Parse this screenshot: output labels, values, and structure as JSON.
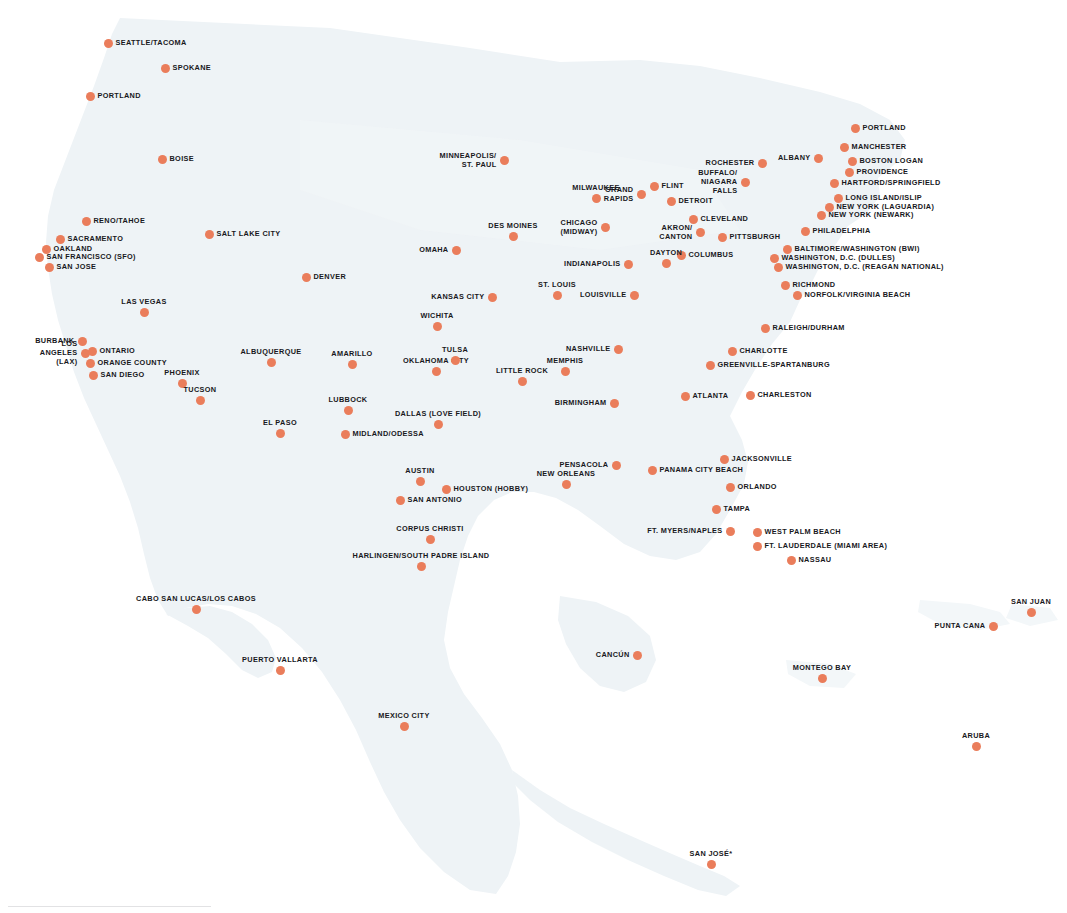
{
  "map": {
    "title": "Destination Route Map",
    "colors": {
      "dot": "#ea7d5b",
      "land": "#eef3f6",
      "label": "#18181c",
      "background": "#ffffff"
    },
    "footnote_marker": "*",
    "cities": [
      {
        "name": "SEATTLE/TACOMA",
        "x": 108,
        "y": 43,
        "pos": "right"
      },
      {
        "name": "SPOKANE",
        "x": 165,
        "y": 68,
        "pos": "right"
      },
      {
        "name": "PORTLAND",
        "x": 90,
        "y": 96,
        "pos": "right"
      },
      {
        "name": "BOISE",
        "x": 162,
        "y": 159,
        "pos": "right"
      },
      {
        "name": "RENO/TAHOE",
        "x": 86,
        "y": 221,
        "pos": "right"
      },
      {
        "name": "SACRAMENTO",
        "x": 60,
        "y": 239,
        "pos": "right"
      },
      {
        "name": "OAKLAND",
        "x": 46,
        "y": 249,
        "pos": "right"
      },
      {
        "name": "SAN FRANCISCO (SFO)",
        "x": 39,
        "y": 257,
        "pos": "right"
      },
      {
        "name": "SAN JOSE",
        "x": 49,
        "y": 267,
        "pos": "right"
      },
      {
        "name": "SALT LAKE CITY",
        "x": 209,
        "y": 234,
        "pos": "right"
      },
      {
        "name": "LAS VEGAS",
        "x": 144,
        "y": 312,
        "pos": "above"
      },
      {
        "name": "BURBANK",
        "x": 82,
        "y": 341,
        "pos": "left"
      },
      {
        "name": "LOS ANGELES\n(LAX)",
        "x": 85,
        "y": 353,
        "pos": "left2"
      },
      {
        "name": "ONTARIO",
        "x": 92,
        "y": 351,
        "pos": "right"
      },
      {
        "name": "ORANGE COUNTY",
        "x": 90,
        "y": 363,
        "pos": "right"
      },
      {
        "name": "SAN DIEGO",
        "x": 93,
        "y": 375,
        "pos": "right"
      },
      {
        "name": "PHOENIX",
        "x": 182,
        "y": 383,
        "pos": "above"
      },
      {
        "name": "TUCSON",
        "x": 200,
        "y": 400,
        "pos": "above"
      },
      {
        "name": "DENVER",
        "x": 306,
        "y": 277,
        "pos": "right"
      },
      {
        "name": "ALBUQUERQUE",
        "x": 271,
        "y": 362,
        "pos": "above"
      },
      {
        "name": "EL PASO",
        "x": 280,
        "y": 433,
        "pos": "above"
      },
      {
        "name": "AMARILLO",
        "x": 352,
        "y": 364,
        "pos": "above"
      },
      {
        "name": "LUBBOCK",
        "x": 348,
        "y": 410,
        "pos": "above"
      },
      {
        "name": "MIDLAND/ODESSA",
        "x": 345,
        "y": 434,
        "pos": "right"
      },
      {
        "name": "DALLAS (LOVE FIELD)",
        "x": 438,
        "y": 424,
        "pos": "above"
      },
      {
        "name": "OKLAHOMA CITY",
        "x": 436,
        "y": 371,
        "pos": "above"
      },
      {
        "name": "TULSA",
        "x": 455,
        "y": 360,
        "pos": "above"
      },
      {
        "name": "WICHITA",
        "x": 437,
        "y": 326,
        "pos": "above"
      },
      {
        "name": "KANSAS CITY",
        "x": 492,
        "y": 297,
        "pos": "left"
      },
      {
        "name": "OMAHA",
        "x": 456,
        "y": 250,
        "pos": "left"
      },
      {
        "name": "DES MOINES",
        "x": 513,
        "y": 236,
        "pos": "above"
      },
      {
        "name": "MINNEAPOLIS/\nST. PAUL",
        "x": 504,
        "y": 160,
        "pos": "left2"
      },
      {
        "name": "MILWAUKEE",
        "x": 596,
        "y": 198,
        "pos": "above"
      },
      {
        "name": "CHICAGO\n(MIDWAY)",
        "x": 605,
        "y": 227,
        "pos": "left2"
      },
      {
        "name": "GRAND\nRAPIDS",
        "x": 641,
        "y": 194,
        "pos": "left2"
      },
      {
        "name": "FLINT",
        "x": 654,
        "y": 186,
        "pos": "right"
      },
      {
        "name": "DETROIT",
        "x": 671,
        "y": 201,
        "pos": "right"
      },
      {
        "name": "CLEVELAND",
        "x": 693,
        "y": 219,
        "pos": "right"
      },
      {
        "name": "AKRON/\nCANTON",
        "x": 700,
        "y": 232,
        "pos": "left2"
      },
      {
        "name": "PITTSBURGH",
        "x": 722,
        "y": 237,
        "pos": "right"
      },
      {
        "name": "COLUMBUS",
        "x": 681,
        "y": 255,
        "pos": "right"
      },
      {
        "name": "DAYTON",
        "x": 666,
        "y": 263,
        "pos": "above"
      },
      {
        "name": "INDIANAPOLIS",
        "x": 628,
        "y": 264,
        "pos": "left"
      },
      {
        "name": "ST. LOUIS",
        "x": 557,
        "y": 295,
        "pos": "above"
      },
      {
        "name": "LOUISVILLE",
        "x": 634,
        "y": 295,
        "pos": "left"
      },
      {
        "name": "ROCHESTER",
        "x": 762,
        "y": 163,
        "pos": "left"
      },
      {
        "name": "BUFFALO/\nNIAGARA FALLS",
        "x": 745,
        "y": 182,
        "pos": "left2"
      },
      {
        "name": "ALBANY",
        "x": 818,
        "y": 158,
        "pos": "left"
      },
      {
        "name": "PORTLAND",
        "x": 855,
        "y": 128,
        "pos": "right"
      },
      {
        "name": "MANCHESTER",
        "x": 844,
        "y": 147,
        "pos": "right"
      },
      {
        "name": "BOSTON LOGAN",
        "x": 852,
        "y": 161,
        "pos": "right"
      },
      {
        "name": "PROVIDENCE",
        "x": 849,
        "y": 172,
        "pos": "right"
      },
      {
        "name": "HARTFORD/SPRINGFIELD",
        "x": 834,
        "y": 183,
        "pos": "right"
      },
      {
        "name": "LONG ISLAND/ISLIP",
        "x": 838,
        "y": 198,
        "pos": "right"
      },
      {
        "name": "NEW YORK (LAGUARDIA)",
        "x": 829,
        "y": 207,
        "pos": "right"
      },
      {
        "name": "NEW YORK (NEWARK)",
        "x": 821,
        "y": 215,
        "pos": "right"
      },
      {
        "name": "PHILADELPHIA",
        "x": 805,
        "y": 231,
        "pos": "right"
      },
      {
        "name": "BALTIMORE/WASHINGTON (BWI)",
        "x": 787,
        "y": 249,
        "pos": "right"
      },
      {
        "name": "WASHINGTON, D.C. (DULLES)",
        "x": 774,
        "y": 258,
        "pos": "right"
      },
      {
        "name": "WASHINGTON, D.C. (REAGAN NATIONAL)",
        "x": 778,
        "y": 267,
        "pos": "right"
      },
      {
        "name": "RICHMOND",
        "x": 785,
        "y": 285,
        "pos": "right"
      },
      {
        "name": "NORFOLK/VIRGINIA BEACH",
        "x": 797,
        "y": 295,
        "pos": "right"
      },
      {
        "name": "RALEIGH/DURHAM",
        "x": 765,
        "y": 328,
        "pos": "right"
      },
      {
        "name": "CHARLOTTE",
        "x": 732,
        "y": 351,
        "pos": "right"
      },
      {
        "name": "GREENVILLE-SPARTANBURG",
        "x": 710,
        "y": 365,
        "pos": "right"
      },
      {
        "name": "NASHVILLE",
        "x": 618,
        "y": 349,
        "pos": "left"
      },
      {
        "name": "MEMPHIS",
        "x": 565,
        "y": 371,
        "pos": "above"
      },
      {
        "name": "BIRMINGHAM",
        "x": 614,
        "y": 403,
        "pos": "left"
      },
      {
        "name": "ATLANTA",
        "x": 685,
        "y": 396,
        "pos": "right"
      },
      {
        "name": "CHARLESTON",
        "x": 750,
        "y": 395,
        "pos": "right"
      },
      {
        "name": "LITTLE ROCK",
        "x": 522,
        "y": 381,
        "pos": "above"
      },
      {
        "name": "AUSTIN",
        "x": 420,
        "y": 481,
        "pos": "above"
      },
      {
        "name": "HOUSTON (HOBBY)",
        "x": 446,
        "y": 489,
        "pos": "right"
      },
      {
        "name": "SAN ANTONIO",
        "x": 400,
        "y": 500,
        "pos": "right"
      },
      {
        "name": "CORPUS CHRISTI",
        "x": 430,
        "y": 539,
        "pos": "above"
      },
      {
        "name": "HARLINGEN/SOUTH PADRE ISLAND",
        "x": 421,
        "y": 566,
        "pos": "above"
      },
      {
        "name": "NEW ORLEANS",
        "x": 566,
        "y": 484,
        "pos": "above"
      },
      {
        "name": "PENSACOLA",
        "x": 616,
        "y": 465,
        "pos": "left"
      },
      {
        "name": "PANAMA CITY BEACH",
        "x": 652,
        "y": 470,
        "pos": "right"
      },
      {
        "name": "JACKSONVILLE",
        "x": 724,
        "y": 459,
        "pos": "right"
      },
      {
        "name": "ORLANDO",
        "x": 730,
        "y": 487,
        "pos": "right"
      },
      {
        "name": "TAMPA",
        "x": 716,
        "y": 509,
        "pos": "right"
      },
      {
        "name": "FT. MYERS/NAPLES",
        "x": 730,
        "y": 531,
        "pos": "left"
      },
      {
        "name": "WEST PALM BEACH",
        "x": 757,
        "y": 532,
        "pos": "right"
      },
      {
        "name": "FT. LAUDERDALE (MIAMI AREA)",
        "x": 757,
        "y": 546,
        "pos": "right"
      },
      {
        "name": "NASSAU",
        "x": 791,
        "y": 560,
        "pos": "right"
      },
      {
        "name": "CABO SAN LUCAS/LOS CABOS",
        "x": 196,
        "y": 609,
        "pos": "above"
      },
      {
        "name": "PUERTO VALLARTA",
        "x": 280,
        "y": 670,
        "pos": "above"
      },
      {
        "name": "MEXICO CITY",
        "x": 404,
        "y": 726,
        "pos": "above"
      },
      {
        "name": "CANCÚN",
        "x": 637,
        "y": 655,
        "pos": "left"
      },
      {
        "name": "MONTEGO BAY",
        "x": 822,
        "y": 678,
        "pos": "above"
      },
      {
        "name": "SAN JUAN",
        "x": 1031,
        "y": 612,
        "pos": "above"
      },
      {
        "name": "PUNTA CANA",
        "x": 993,
        "y": 626,
        "pos": "left"
      },
      {
        "name": "ARUBA",
        "x": 976,
        "y": 746,
        "pos": "above"
      },
      {
        "name": "SAN JOSÉ*",
        "x": 711,
        "y": 864,
        "pos": "above"
      }
    ]
  }
}
